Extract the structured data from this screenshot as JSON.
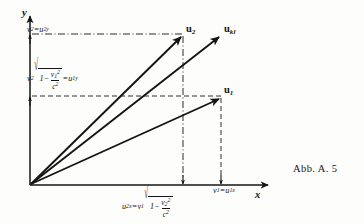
{
  "figure": {
    "caption": "Abb. A. 5",
    "axes": {
      "x_label": "x",
      "y_label": "y"
    },
    "vectors": [
      {
        "name": "u2",
        "label_base": "u",
        "label_sub": "2"
      },
      {
        "name": "ukl",
        "label_base": "u",
        "label_sub": "kl"
      },
      {
        "name": "u1",
        "label_base": "u",
        "label_sub": "1"
      }
    ],
    "annotations": {
      "y_upper": {
        "lhs_base": "v",
        "lhs_sub": "2",
        "equals": "=",
        "rhs_base": "u",
        "rhs_sub": "2y"
      },
      "y_lower": {
        "coefficient_base": "v",
        "coefficient_sub": "2",
        "radical_sign": "√",
        "one": "1",
        "minus": "−",
        "numerator_base": "v",
        "numerator_sub": "1",
        "numerator_sup": "2",
        "denominator_base": "c",
        "denominator_sup": "2",
        "equals": "=",
        "rhs_base": "u",
        "rhs_sub": "1y"
      },
      "x_left": {
        "lhs_base": "u",
        "lhs_sub": "2x",
        "equals": "=",
        "coefficient_base": "v",
        "coefficient_sub": "1",
        "radical_sign": "√",
        "one": "1",
        "minus": "−",
        "numerator_base": "v",
        "numerator_sub": "2",
        "numerator_sup": "2",
        "denominator_base": "c",
        "denominator_sup": "2"
      },
      "x_right": {
        "lhs_base": "v",
        "lhs_sub": "1",
        "equals": "=",
        "rhs_base": "u",
        "rhs_sub": "1x"
      }
    },
    "colors": {
      "ink": "#141414",
      "background": "#fdfdfb"
    }
  }
}
